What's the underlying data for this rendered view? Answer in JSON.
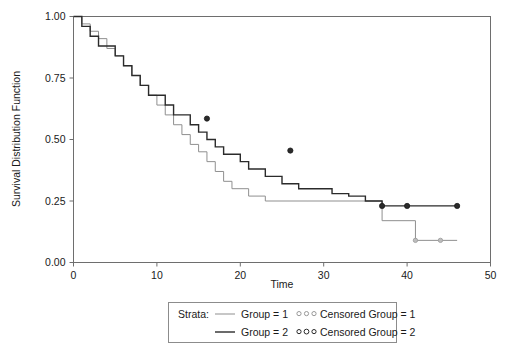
{
  "chart_data": {
    "type": "line",
    "subtype": "kaplan-meier-step",
    "title": "",
    "xlabel": "Time",
    "ylabel": "Survival Distribution Function",
    "xlim": [
      0,
      50
    ],
    "ylim": [
      0.0,
      1.0
    ],
    "xticks": [
      0,
      10,
      20,
      30,
      40,
      50
    ],
    "xtick_labels": [
      "0",
      "10",
      "20",
      "30",
      "40",
      "50"
    ],
    "yticks": [
      0.0,
      0.25,
      0.5,
      0.75,
      1.0
    ],
    "ytick_labels": [
      "0.00",
      "0.25",
      "0.50",
      "0.75",
      "1.00"
    ],
    "grid": false,
    "legend_position": "below-center",
    "legend_title": "Strata:",
    "series": [
      {
        "name": "Group = 1",
        "color": "#8f8f8f",
        "width": 1.0,
        "steps_x": [
          0,
          1,
          2,
          3,
          4,
          5,
          6,
          7,
          8,
          9,
          10,
          11,
          12,
          13,
          14,
          15,
          16,
          17,
          18,
          19,
          21,
          23,
          25,
          28,
          35,
          37,
          41,
          46
        ],
        "steps_y": [
          1.0,
          0.97,
          0.94,
          0.91,
          0.87,
          0.84,
          0.8,
          0.76,
          0.72,
          0.68,
          0.64,
          0.6,
          0.56,
          0.52,
          0.48,
          0.45,
          0.41,
          0.37,
          0.33,
          0.3,
          0.27,
          0.25,
          0.25,
          0.25,
          0.25,
          0.17,
          0.09,
          0.09
        ],
        "censored_x": [
          41,
          44
        ],
        "censored_y": [
          0.09,
          0.09
        ]
      },
      {
        "name": "Group = 2",
        "color": "#2b2b2b",
        "width": 1.4,
        "steps_x": [
          0,
          1,
          2,
          3,
          5,
          6,
          7,
          8,
          9,
          11,
          12,
          14,
          15,
          16,
          17,
          18,
          20,
          21,
          23,
          25,
          27,
          31,
          33,
          35,
          37,
          46
        ],
        "steps_y": [
          1.0,
          0.96,
          0.92,
          0.88,
          0.84,
          0.8,
          0.76,
          0.72,
          0.68,
          0.64,
          0.6,
          0.56,
          0.53,
          0.5,
          0.47,
          0.44,
          0.41,
          0.38,
          0.35,
          0.32,
          0.3,
          0.28,
          0.27,
          0.25,
          0.23,
          0.23
        ],
        "censored_x": [
          16,
          26,
          37,
          40,
          46
        ],
        "censored_y": [
          0.585,
          0.455,
          0.23,
          0.23,
          0.23
        ]
      }
    ],
    "legend_entries": [
      {
        "line_label": "Group = 1",
        "marker_label": "Censored Group = 1",
        "color": "#8f8f8f"
      },
      {
        "line_label": "Group = 2",
        "marker_label": "Censored Group = 2",
        "color": "#2b2b2b"
      }
    ]
  },
  "axes": {
    "xlabel": "Time",
    "ylabel": "Survival Distribution Function"
  },
  "ticks": {
    "x": [
      "0",
      "10",
      "20",
      "30",
      "40",
      "50"
    ],
    "y": [
      "0.00",
      "0.25",
      "0.50",
      "0.75",
      "1.00"
    ]
  },
  "legend": {
    "title": "Strata:",
    "row1_line": "Group = 1",
    "row1_marker": "Censored Group = 1",
    "row2_line": "Group = 2",
    "row2_marker": "Censored Group = 2"
  }
}
